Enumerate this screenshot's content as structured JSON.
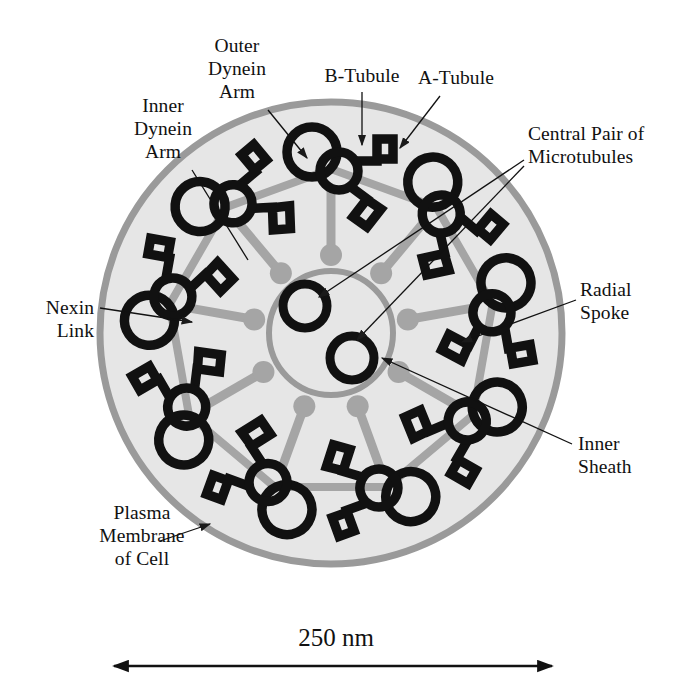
{
  "figure": {
    "colors": {
      "membrane_ring": "#9a9a9a",
      "cytoplasm_fill": "#e6e6e6",
      "inner_sheath": "#9a9a9a",
      "radial_spoke": "#a5a5a5",
      "nexin_link": "#a5a5a5",
      "microtubule": "#111111",
      "text": "#111111",
      "background": "#ffffff"
    },
    "geometry": {
      "center_x": 331,
      "center_y": 333,
      "outer_radius": 235,
      "membrane_thickness": 7,
      "doublet_ring_radius": 168,
      "doublet_count": 9,
      "inner_sheath_radius": 62
    }
  },
  "labels": [
    {
      "id": "inner-dynein-arm",
      "lines": [
        "Inner",
        "Dynein",
        "Arm"
      ],
      "x": 163,
      "y": 112,
      "anchor": "middle",
      "leader": [
        [
          192,
          170
        ],
        [
          248,
          260
        ]
      ],
      "arrow": "tick"
    },
    {
      "id": "outer-dynein-arm",
      "lines": [
        "Outer",
        "Dynein",
        "Arm"
      ],
      "x": 237,
      "y": 52,
      "anchor": "middle",
      "leader": [
        [
          268,
          110
        ],
        [
          307,
          158
        ]
      ],
      "arrow": "head"
    },
    {
      "id": "b-tubule",
      "lines": [
        "B-Tubule"
      ],
      "x": 362,
      "y": 82,
      "anchor": "middle",
      "leader": [
        [
          362,
          92
        ],
        [
          362,
          145
        ]
      ],
      "arrow": "head"
    },
    {
      "id": "a-tubule",
      "lines": [
        "A-Tubule"
      ],
      "x": 456,
      "y": 84,
      "anchor": "middle",
      "leader": [
        [
          440,
          96
        ],
        [
          400,
          148
        ]
      ],
      "arrow": "head"
    },
    {
      "id": "central-pair-of-microtubules",
      "lines": [
        "Central Pair of",
        "Microtubules"
      ],
      "x": 528,
      "y": 140,
      "anchor": "start",
      "leader": [
        [
          524,
          160
        ],
        [
          319,
          297
        ]
      ],
      "arrow": "head",
      "leader2": [
        [
          524,
          166
        ],
        [
          357,
          340
        ]
      ],
      "arrow2": "head"
    },
    {
      "id": "radial-spoke",
      "lines": [
        "Radial",
        "Spoke"
      ],
      "x": 580,
      "y": 296,
      "anchor": "start",
      "leader": [
        [
          576,
          300
        ],
        [
          462,
          342
        ]
      ],
      "arrow": "head"
    },
    {
      "id": "inner-sheath",
      "lines": [
        "Inner",
        "Sheath"
      ],
      "x": 578,
      "y": 450,
      "anchor": "start",
      "leader": [
        [
          572,
          444
        ],
        [
          382,
          358
        ]
      ],
      "arrow": "head"
    },
    {
      "id": "nexin-link",
      "lines": [
        "Nexin",
        "Link"
      ],
      "x": 94,
      "y": 314,
      "anchor": "end",
      "leader": [
        [
          100,
          308
        ],
        [
          192,
          322
        ]
      ],
      "arrow": "head"
    },
    {
      "id": "plasma-membrane-of-cell",
      "lines": [
        "Plasma",
        "Membrane",
        "of Cell"
      ],
      "x": 142,
      "y": 519,
      "anchor": "middle",
      "leader": [
        [
          160,
          541
        ],
        [
          210,
          524
        ]
      ],
      "arrow": "head"
    }
  ],
  "scale_bar": {
    "text": "250 nm",
    "text_x": 336,
    "text_y": 646,
    "line_y": 666,
    "x_start": 100,
    "x_end": 566
  },
  "structures": {
    "plasma_membrane": "Plasma Membrane of Cell",
    "outer_doublets": "9 outer microtubule doublets (A-tubule + B-tubule)",
    "central_pair": "Central Pair of Microtubules",
    "inner_sheath": "Inner Sheath",
    "radial_spokes": "Radial Spoke",
    "nexin_links": "Nexin Link",
    "outer_dynein_arms": "Outer Dynein Arm",
    "inner_dynein_arms": "Inner Dynein Arm"
  },
  "chart_data": {
    "type": "diagram",
    "scale": "250 nm",
    "doublet_count": 9,
    "central_pair_count": 2,
    "doublet_angles_deg": [
      -90,
      -50,
      -10,
      30,
      70,
      110,
      150,
      190,
      230
    ]
  }
}
